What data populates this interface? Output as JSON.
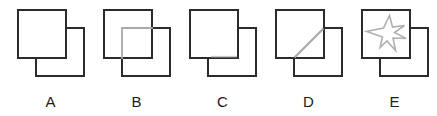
{
  "sheet": {
    "title": "Overlapping squares multiple-choice figure row",
    "background_color": "#ffffff",
    "width": 437,
    "height": 116
  },
  "style": {
    "square_stroke_color": "#2b2b2b",
    "square_stroke_width": 2,
    "overlay_stroke_color": "#a8a8a8",
    "overlay_stroke_width": 1.6,
    "faint_stroke_color": "#c2c2c2",
    "label_color": "#1c1c1c",
    "square_size": 48,
    "offset_x": 28,
    "offset_y": 28
  },
  "options": [
    {
      "id": "A",
      "label": "A",
      "front_square": "top-left",
      "back_square": "bottom-right",
      "overlap_content": "none",
      "overlap_description": "Back square hidden behind front square; overlap region is empty."
    },
    {
      "id": "B",
      "label": "B",
      "front_square": "top-left",
      "back_square": "bottom-right",
      "overlap_content": "full-rectangle",
      "overlap_description": "Back square drawn through the front square; the overlap rectangle is fully outlined in grey."
    },
    {
      "id": "C",
      "label": "C",
      "front_square": "top-left",
      "back_square": "bottom-right",
      "overlap_content": "partial-bottom-edge",
      "overlap_description": "A faint grey line appears along the lower part of the overlap region only."
    },
    {
      "id": "D",
      "label": "D",
      "front_square": "top-left",
      "back_square": "bottom-right",
      "overlap_content": "diagonal",
      "overlap_description": "A grey diagonal line crosses the overlap region from its lower-left corner to its upper-right corner."
    },
    {
      "id": "E",
      "label": "E",
      "front_square": "top-left",
      "back_square": "bottom-right",
      "overlap_content": "star",
      "overlap_description": "A grey five-pointed star outline is drawn inside the front (top-left) square."
    }
  ]
}
